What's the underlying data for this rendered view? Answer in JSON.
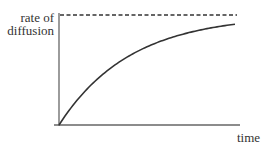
{
  "chart_data": {
    "type": "line",
    "title": "",
    "xlabel": "time",
    "ylabel": "rate of diffusion",
    "ylabel_lines": [
      "rate of",
      "diffusion"
    ],
    "x": [
      0,
      10,
      20,
      30,
      40,
      50,
      60,
      70,
      80,
      90,
      100
    ],
    "series": [
      {
        "name": "rate of diffusion",
        "values": [
          0,
          0.23,
          0.41,
          0.55,
          0.65,
          0.73,
          0.79,
          0.84,
          0.87,
          0.9,
          0.92
        ]
      },
      {
        "name": "maximum rate (dashed asymptote)",
        "values": [
          1,
          1,
          1,
          1,
          1,
          1,
          1,
          1,
          1,
          1,
          1
        ]
      }
    ],
    "xlim": [
      0,
      100
    ],
    "ylim": [
      0,
      1
    ],
    "grid": false,
    "legend": "none",
    "annotations": [
      "dashed horizontal line at maximum rate"
    ]
  },
  "labels": {
    "y_line1": "rate of",
    "y_line2": "diffusion",
    "x": "time"
  },
  "colors": {
    "axis": "#555555",
    "curve": "#333333",
    "dashed": "#333333"
  }
}
